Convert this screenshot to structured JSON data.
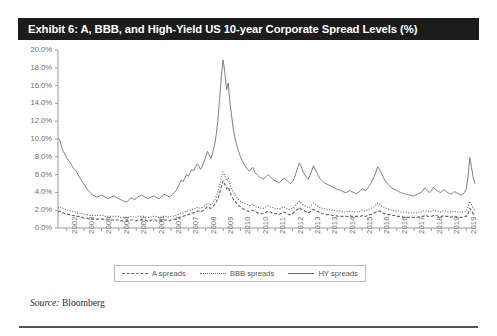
{
  "exhibit": {
    "title": "Exhibit 6: A, BBB, and High-Yield US 10-year Corporate Spread Levels (%)",
    "title_bg": "#1c1c1c",
    "source_prefix": "Source:",
    "source_value": "Bloomberg"
  },
  "legend": {
    "position": "bottom-center",
    "items": [
      {
        "label": "A spreads",
        "style": "dashed"
      },
      {
        "label": "BBB spreads",
        "style": "dotted"
      },
      {
        "label": "HY spreads",
        "style": "solid"
      }
    ]
  },
  "chart_data": {
    "type": "line",
    "title": "Exhibit 6: A, BBB, and High-Yield US 10-year Corporate Spread Levels (%)",
    "xlabel": "",
    "ylabel": "",
    "ylim": [
      0,
      20
    ],
    "ytick_values": [
      0,
      2,
      4,
      6,
      8,
      10,
      12,
      14,
      16,
      18,
      20
    ],
    "ytick_labels": [
      "0.0%",
      "2.0%",
      "4.0%",
      "6.0%",
      "8.0%",
      "10.0%",
      "12.0%",
      "14.0%",
      "16.0%",
      "18.0%",
      "20.0%"
    ],
    "grid": false,
    "xtick_labels": [
      "2002",
      "2003",
      "2004",
      "2004",
      "2005",
      "2006",
      "2007",
      "2007",
      "2008",
      "2009",
      "2010",
      "2010",
      "2011",
      "2012",
      "2013",
      "2013",
      "2014",
      "2015",
      "2016",
      "2016",
      "2017",
      "2018",
      "2019",
      "2019"
    ],
    "x_start_year": 2002,
    "x_end_year": 2020.2,
    "line_color": "#6a6a6a",
    "series": [
      {
        "name": "HY spreads",
        "style": "solid",
        "values": [
          10.1,
          9.9,
          9.2,
          8.6,
          8.3,
          7.9,
          7.6,
          7.4,
          7.0,
          6.7,
          6.5,
          6.2,
          5.8,
          5.5,
          5.2,
          4.9,
          4.6,
          4.3,
          4.1,
          3.9,
          3.7,
          3.6,
          3.5,
          3.5,
          3.6,
          3.7,
          3.6,
          3.5,
          3.4,
          3.3,
          3.4,
          3.5,
          3.6,
          3.5,
          3.4,
          3.3,
          3.2,
          3.1,
          3.0,
          2.9,
          3.0,
          3.2,
          3.4,
          3.3,
          3.2,
          3.3,
          3.5,
          3.6,
          3.7,
          3.6,
          3.5,
          3.4,
          3.3,
          3.4,
          3.5,
          3.6,
          3.5,
          3.4,
          3.3,
          3.4,
          3.6,
          3.8,
          3.7,
          3.6,
          3.5,
          3.6,
          3.8,
          4.0,
          4.2,
          4.6,
          5.0,
          5.4,
          5.2,
          5.6,
          6.0,
          5.8,
          6.2,
          6.6,
          6.4,
          6.8,
          7.2,
          7.0,
          6.6,
          6.9,
          7.4,
          8.0,
          8.6,
          8.2,
          7.8,
          8.4,
          9.2,
          10.4,
          12.0,
          14.5,
          17.0,
          18.9,
          17.5,
          15.5,
          16.3,
          14.0,
          12.5,
          11.0,
          10.0,
          9.2,
          8.6,
          8.0,
          7.6,
          7.2,
          6.9,
          6.6,
          6.4,
          6.6,
          6.8,
          6.4,
          6.1,
          5.9,
          5.7,
          5.6,
          5.5,
          5.6,
          5.8,
          6.0,
          5.8,
          5.6,
          5.4,
          5.3,
          5.2,
          5.1,
          5.2,
          5.4,
          5.6,
          5.5,
          5.3,
          5.1,
          5.0,
          5.2,
          5.6,
          6.2,
          6.8,
          7.3,
          6.9,
          6.4,
          6.0,
          5.7,
          5.5,
          5.9,
          6.4,
          7.0,
          6.6,
          6.2,
          5.8,
          5.5,
          5.3,
          5.1,
          5.0,
          4.9,
          4.8,
          4.7,
          4.6,
          4.5,
          4.4,
          4.3,
          4.3,
          4.2,
          4.1,
          4.0,
          4.0,
          4.1,
          4.2,
          4.1,
          4.0,
          3.9,
          3.9,
          4.0,
          4.2,
          4.4,
          4.3,
          4.2,
          4.4,
          4.7,
          5.0,
          5.4,
          5.8,
          6.3,
          6.9,
          6.6,
          6.2,
          5.8,
          5.4,
          5.1,
          4.9,
          4.7,
          4.5,
          4.4,
          4.3,
          4.2,
          4.1,
          4.0,
          3.9,
          3.9,
          3.8,
          3.8,
          3.7,
          3.7,
          3.6,
          3.6,
          3.7,
          3.8,
          3.9,
          4.0,
          4.2,
          4.5,
          4.3,
          4.1,
          4.0,
          4.2,
          4.6,
          4.4,
          4.2,
          4.1,
          4.0,
          4.1,
          4.3,
          4.2,
          4.0,
          3.9,
          3.8,
          3.9,
          4.1,
          4.0,
          3.9,
          3.8,
          3.7,
          3.8,
          4.0,
          4.4,
          5.8,
          7.9,
          6.8,
          5.6,
          5.0
        ]
      },
      {
        "name": "BBB spreads",
        "style": "dotted",
        "values": [
          2.3,
          2.4,
          2.3,
          2.2,
          2.1,
          2.0,
          2.0,
          1.9,
          1.9,
          1.8,
          1.8,
          1.7,
          1.7,
          1.6,
          1.6,
          1.5,
          1.5,
          1.5,
          1.4,
          1.4,
          1.4,
          1.4,
          1.4,
          1.4,
          1.4,
          1.4,
          1.4,
          1.3,
          1.3,
          1.3,
          1.3,
          1.3,
          1.3,
          1.3,
          1.3,
          1.3,
          1.2,
          1.2,
          1.2,
          1.2,
          1.2,
          1.2,
          1.3,
          1.3,
          1.2,
          1.2,
          1.3,
          1.3,
          1.3,
          1.3,
          1.3,
          1.2,
          1.2,
          1.2,
          1.3,
          1.3,
          1.3,
          1.2,
          1.2,
          1.2,
          1.3,
          1.3,
          1.3,
          1.3,
          1.2,
          1.3,
          1.3,
          1.4,
          1.4,
          1.5,
          1.6,
          1.7,
          1.7,
          1.8,
          1.9,
          1.9,
          2.0,
          2.1,
          2.1,
          2.2,
          2.3,
          2.3,
          2.2,
          2.3,
          2.4,
          2.6,
          2.8,
          2.7,
          2.6,
          2.8,
          3.1,
          3.5,
          4.0,
          4.8,
          5.6,
          6.3,
          5.9,
          5.3,
          5.6,
          4.9,
          4.4,
          4.0,
          3.7,
          3.4,
          3.2,
          3.0,
          2.9,
          2.8,
          2.7,
          2.6,
          2.5,
          2.6,
          2.7,
          2.5,
          2.4,
          2.3,
          2.3,
          2.2,
          2.2,
          2.3,
          2.4,
          2.5,
          2.4,
          2.3,
          2.3,
          2.2,
          2.2,
          2.1,
          2.2,
          2.3,
          2.4,
          2.3,
          2.2,
          2.1,
          2.1,
          2.2,
          2.4,
          2.6,
          2.8,
          3.0,
          2.8,
          2.6,
          2.5,
          2.4,
          2.3,
          2.4,
          2.6,
          2.8,
          2.7,
          2.5,
          2.4,
          2.3,
          2.2,
          2.2,
          2.1,
          2.1,
          2.1,
          2.0,
          2.0,
          2.0,
          1.9,
          1.9,
          1.9,
          1.9,
          1.8,
          1.8,
          1.8,
          1.9,
          1.9,
          1.9,
          1.8,
          1.8,
          1.8,
          1.8,
          1.9,
          2.0,
          1.9,
          1.9,
          2.0,
          2.1,
          2.2,
          2.3,
          2.4,
          2.6,
          2.8,
          2.7,
          2.5,
          2.4,
          2.3,
          2.2,
          2.1,
          2.1,
          2.0,
          2.0,
          1.9,
          1.9,
          1.9,
          1.8,
          1.8,
          1.8,
          1.8,
          1.7,
          1.7,
          1.7,
          1.7,
          1.7,
          1.7,
          1.8,
          1.8,
          1.8,
          1.9,
          2.0,
          1.9,
          1.9,
          1.8,
          1.9,
          2.0,
          2.0,
          1.9,
          1.9,
          1.8,
          1.9,
          1.9,
          1.9,
          1.8,
          1.8,
          1.8,
          1.8,
          1.9,
          1.8,
          1.8,
          1.8,
          1.7,
          1.8,
          1.8,
          1.9,
          2.3,
          3.0,
          2.6,
          2.2,
          2.0
        ]
      },
      {
        "name": "A spreads",
        "style": "dashed",
        "values": [
          1.8,
          1.9,
          1.8,
          1.7,
          1.6,
          1.6,
          1.5,
          1.5,
          1.4,
          1.4,
          1.3,
          1.3,
          1.3,
          1.2,
          1.2,
          1.1,
          1.1,
          1.1,
          1.0,
          1.0,
          1.0,
          1.0,
          1.0,
          1.0,
          1.0,
          1.0,
          1.0,
          0.9,
          0.9,
          0.9,
          0.9,
          0.9,
          0.9,
          0.9,
          0.9,
          0.9,
          0.8,
          0.8,
          0.8,
          0.8,
          0.8,
          0.8,
          0.9,
          0.9,
          0.8,
          0.8,
          0.9,
          0.9,
          0.9,
          0.9,
          0.9,
          0.8,
          0.8,
          0.8,
          0.9,
          0.9,
          0.9,
          0.8,
          0.8,
          0.8,
          0.9,
          0.9,
          0.9,
          0.9,
          0.8,
          0.9,
          0.9,
          1.0,
          1.0,
          1.1,
          1.2,
          1.3,
          1.3,
          1.4,
          1.5,
          1.5,
          1.6,
          1.7,
          1.7,
          1.8,
          1.9,
          1.9,
          1.8,
          1.9,
          2.0,
          2.2,
          2.4,
          2.3,
          2.2,
          2.4,
          2.6,
          2.9,
          3.3,
          3.9,
          4.6,
          5.3,
          4.9,
          4.4,
          4.6,
          4.0,
          3.6,
          3.2,
          3.0,
          2.7,
          2.5,
          2.4,
          2.2,
          2.1,
          2.0,
          1.9,
          1.9,
          2.0,
          2.0,
          1.9,
          1.8,
          1.7,
          1.7,
          1.6,
          1.6,
          1.7,
          1.8,
          1.9,
          1.8,
          1.7,
          1.7,
          1.6,
          1.6,
          1.5,
          1.6,
          1.7,
          1.8,
          1.7,
          1.6,
          1.5,
          1.5,
          1.6,
          1.8,
          2.0,
          2.1,
          2.3,
          2.1,
          2.0,
          1.9,
          1.8,
          1.7,
          1.8,
          2.0,
          2.1,
          2.0,
          1.9,
          1.8,
          1.7,
          1.6,
          1.6,
          1.5,
          1.5,
          1.5,
          1.5,
          1.4,
          1.4,
          1.4,
          1.3,
          1.3,
          1.3,
          1.3,
          1.3,
          1.3,
          1.3,
          1.4,
          1.3,
          1.3,
          1.3,
          1.3,
          1.3,
          1.3,
          1.4,
          1.4,
          1.3,
          1.4,
          1.5,
          1.5,
          1.6,
          1.7,
          1.8,
          1.9,
          1.9,
          1.8,
          1.7,
          1.6,
          1.6,
          1.5,
          1.5,
          1.4,
          1.4,
          1.4,
          1.3,
          1.3,
          1.3,
          1.3,
          1.2,
          1.2,
          1.2,
          1.2,
          1.2,
          1.2,
          1.2,
          1.2,
          1.2,
          1.3,
          1.3,
          1.3,
          1.4,
          1.4,
          1.3,
          1.3,
          1.3,
          1.4,
          1.4,
          1.4,
          1.3,
          1.3,
          1.3,
          1.4,
          1.3,
          1.3,
          1.3,
          1.2,
          1.3,
          1.3,
          1.3,
          1.2,
          1.2,
          1.2,
          1.2,
          1.3,
          1.3,
          1.6,
          2.2,
          1.9,
          1.6,
          1.4
        ]
      }
    ]
  }
}
